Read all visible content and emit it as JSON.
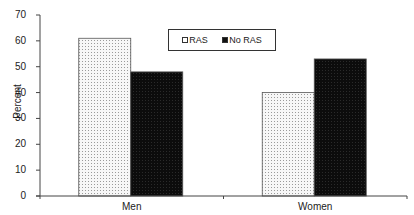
{
  "chart_data": {
    "type": "bar",
    "title": "",
    "xlabel": "",
    "ylabel": "Percent",
    "ylim": [
      0,
      70
    ],
    "yticks": [
      0,
      10,
      20,
      30,
      40,
      50,
      60,
      70
    ],
    "grid": false,
    "legend_position": "top-center",
    "categories": [
      "Men",
      "Women"
    ],
    "series": [
      {
        "name": "RAS",
        "values": [
          61,
          40
        ],
        "pattern": "light-dotted",
        "color": "#f2f2f2"
      },
      {
        "name": "No RAS",
        "values": [
          48,
          53
        ],
        "pattern": "solid-dark",
        "color": "#111111"
      }
    ]
  },
  "labels": {
    "ylabel": "Percent",
    "ticks": [
      "0",
      "10",
      "20",
      "30",
      "40",
      "50",
      "60",
      "70"
    ],
    "categories": [
      "Men",
      "Women"
    ],
    "legend": [
      "RAS",
      "No RAS"
    ]
  }
}
